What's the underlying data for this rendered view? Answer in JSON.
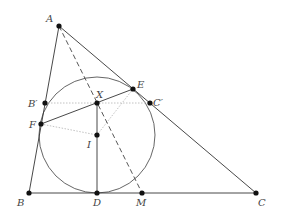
{
  "diagram": {
    "type": "geometry",
    "colors": {
      "line": "#333333",
      "dotted": "#bbbbbb",
      "point": "#111111",
      "label": "#444444"
    },
    "points": {
      "A": {
        "label": "A",
        "x": 59,
        "y": 26,
        "lx": 46,
        "ly": 22
      },
      "B": {
        "label": "B",
        "x": 29,
        "y": 193,
        "lx": 17,
        "ly": 206
      },
      "C": {
        "label": "C",
        "x": 256,
        "y": 193,
        "lx": 258,
        "ly": 206
      },
      "D": {
        "label": "D",
        "x": 97,
        "y": 193,
        "lx": 93,
        "ly": 206
      },
      "M": {
        "label": "M",
        "x": 142,
        "y": 193,
        "lx": 136,
        "ly": 206
      },
      "E": {
        "label": "E",
        "x": 133,
        "y": 89,
        "lx": 137,
        "ly": 88
      },
      "F": {
        "label": "F",
        "x": 41,
        "y": 124,
        "lx": 29,
        "ly": 128
      },
      "X": {
        "label": "X",
        "x": 97,
        "y": 103,
        "lx": 96,
        "ly": 98
      },
      "I": {
        "label": "I",
        "x": 97,
        "y": 135,
        "lx": 87,
        "ly": 148
      },
      "Bp": {
        "label": "B′",
        "x": 45,
        "y": 103,
        "lx": 28,
        "ly": 107
      },
      "Cp": {
        "label": "C′",
        "x": 150,
        "y": 103,
        "lx": 153,
        "ly": 106
      }
    },
    "incircle": {
      "cx": 97,
      "cy": 135,
      "r": 58
    },
    "segments_solid": [
      [
        "A",
        "B"
      ],
      [
        "B",
        "C"
      ],
      [
        "C",
        "A"
      ],
      [
        "F",
        "E"
      ],
      [
        "X",
        "D"
      ]
    ],
    "segments_dashed": [
      [
        "A",
        "M"
      ]
    ],
    "segments_dotted": [
      [
        "Bp",
        "Cp"
      ],
      [
        "F",
        "I"
      ],
      [
        "I",
        "E"
      ]
    ]
  }
}
